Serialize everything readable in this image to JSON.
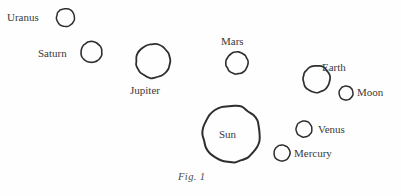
{
  "figure": {
    "caption": "Fig. 1",
    "background_color": "#fefefe",
    "stroke_color": "#2e2e2e",
    "text_color": "#3a3a3a"
  },
  "bodies": [
    {
      "name": "Uranus",
      "label": "Uranus",
      "label_position": "left",
      "cx": 65.5,
      "cy": 17.5,
      "r": 9.0,
      "stroke_width": 1.5,
      "label_x": 7,
      "label_y": 11
    },
    {
      "name": "Saturn",
      "label": "Saturn",
      "label_position": "left",
      "cx": 91.5,
      "cy": 52.0,
      "r": 10.5,
      "stroke_width": 1.6,
      "label_x": 38,
      "label_y": 47
    },
    {
      "name": "Jupiter",
      "label": "Jupiter",
      "label_position": "below",
      "cx": 153.0,
      "cy": 61.0,
      "r": 17.0,
      "stroke_width": 1.8,
      "label_x": 130,
      "label_y": 84
    },
    {
      "name": "Mars",
      "label": "Mars",
      "label_position": "above",
      "cx": 237.0,
      "cy": 63.0,
      "r": 11.0,
      "stroke_width": 1.6,
      "label_x": 221,
      "label_y": 35
    },
    {
      "name": "Earth",
      "label": "Earth",
      "label_position": "above-right",
      "cx": 316.5,
      "cy": 79.0,
      "r": 13.5,
      "stroke_width": 1.7,
      "label_x": 322,
      "label_y": 61
    },
    {
      "name": "Moon",
      "label": "Moon",
      "label_position": "right",
      "cx": 346.0,
      "cy": 93.0,
      "r": 7.0,
      "stroke_width": 1.5,
      "label_x": 357,
      "label_y": 86
    },
    {
      "name": "Sun",
      "label": "Sun",
      "label_position": "inside",
      "cx": 231.5,
      "cy": 134.0,
      "r": 28.5,
      "stroke_width": 2.0,
      "label_x": 219,
      "label_y": 128
    },
    {
      "name": "Venus",
      "label": "Venus",
      "label_position": "right",
      "cx": 304.0,
      "cy": 129.0,
      "r": 8.0,
      "stroke_width": 1.5,
      "label_x": 318,
      "label_y": 123
    },
    {
      "name": "Mercury",
      "label": "Mercury",
      "label_position": "right",
      "cx": 282.0,
      "cy": 153.0,
      "r": 8.0,
      "stroke_width": 1.5,
      "label_x": 294,
      "label_y": 147
    }
  ],
  "caption_position": {
    "x": 178,
    "y": 171
  }
}
